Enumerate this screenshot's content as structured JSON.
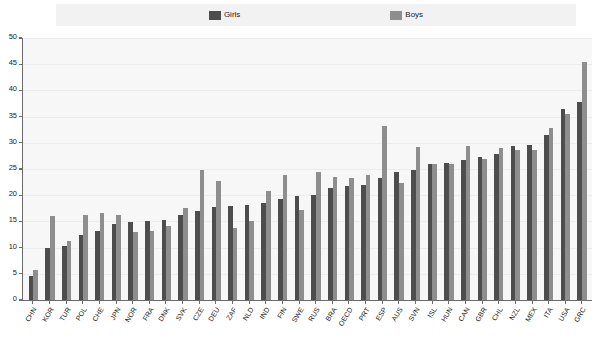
{
  "legend": {
    "entries": [
      {
        "label": "Girls",
        "color": "#4d4d4d",
        "key": "girls"
      },
      {
        "label": "Boys",
        "color": "#8e8e8e",
        "key": "boys"
      }
    ]
  },
  "axis": {
    "y_ticks": [
      "0",
      "5",
      "10",
      "15",
      "20",
      "25",
      "30",
      "35",
      "40",
      "45",
      "50"
    ]
  },
  "chart_data": {
    "type": "bar",
    "title": "",
    "subtitle": "",
    "xlabel": "",
    "ylabel": "",
    "ylim": [
      0,
      50
    ],
    "ytick_step": 5,
    "grid": true,
    "legend_position": "top-center",
    "orientation": "vertical",
    "grouping": "grouped",
    "categories": [
      "CHN",
      "KOR",
      "TUR",
      "POL",
      "CHE",
      "JPN",
      "NOR",
      "FRA",
      "DNK",
      "SVK",
      "CZE",
      "DEU",
      "ZAF",
      "NLD",
      "IND",
      "FIN",
      "SWE",
      "RUS",
      "BRA",
      "OECD",
      "PRT",
      "ESP",
      "AUS",
      "SVN",
      "ISL",
      "HUN",
      "CAN",
      "GBR",
      "CHL",
      "NZL",
      "MEX",
      "ITA",
      "USA",
      "GRC"
    ],
    "series": [
      {
        "name": "Girls",
        "color": "#4d4d4d",
        "values": [
          4.5,
          10.0,
          10.3,
          12.4,
          13.1,
          14.5,
          14.8,
          15.0,
          15.3,
          16.3,
          17.0,
          17.7,
          17.9,
          18.1,
          18.5,
          19.3,
          19.8,
          20.1,
          21.4,
          21.7,
          22.0,
          23.3,
          24.4,
          24.8,
          25.9,
          26.2,
          26.7,
          27.2,
          27.8,
          29.4,
          29.5,
          31.5,
          36.5,
          37.7
        ]
      },
      {
        "name": "Boys",
        "color": "#8e8e8e",
        "values": [
          5.8,
          16.1,
          11.3,
          16.3,
          16.7,
          16.2,
          13.0,
          13.2,
          14.2,
          17.5,
          24.8,
          22.7,
          13.8,
          15.0,
          20.8,
          23.8,
          17.2,
          24.4,
          23.4,
          23.2,
          23.8,
          33.2,
          22.4,
          29.2,
          26.0,
          25.9,
          29.4,
          27.0,
          29.1,
          28.7,
          28.6,
          32.8,
          35.5,
          45.5
        ]
      }
    ]
  }
}
